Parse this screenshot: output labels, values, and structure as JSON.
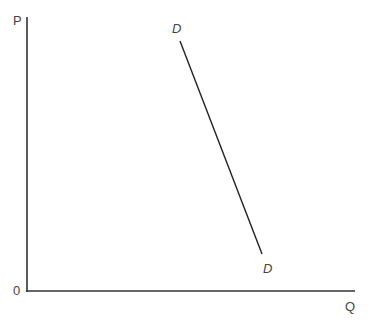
{
  "diagram": {
    "type": "demand-curve",
    "axes": {
      "y_label": "P",
      "x_label": "Q",
      "origin_label": "0"
    },
    "curve": {
      "label_top": "D",
      "label_bottom": "D",
      "color": "#222222"
    },
    "axis_color": "#333333"
  }
}
